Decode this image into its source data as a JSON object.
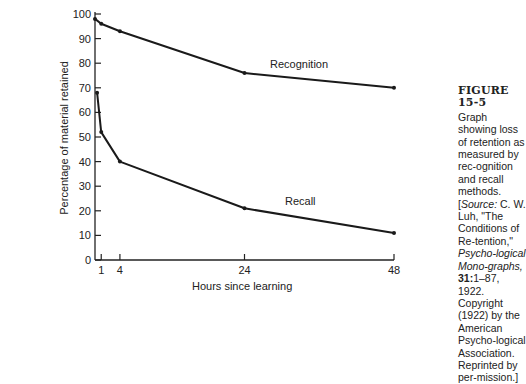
{
  "chart_data": {
    "type": "line",
    "title": "",
    "xlabel": "Hours since learning",
    "ylabel": "Percentage of material retained",
    "xlim": [
      0,
      48
    ],
    "ylim": [
      0,
      100
    ],
    "x_ticks": [
      1,
      4,
      24,
      48
    ],
    "y_ticks": [
      0,
      10,
      20,
      30,
      40,
      50,
      60,
      70,
      80,
      90,
      100
    ],
    "grid": false,
    "legend": "inline labels on lines",
    "series": [
      {
        "name": "Recognition",
        "x": [
          0,
          1,
          4,
          24,
          48
        ],
        "values": [
          98,
          96,
          93,
          76,
          70
        ]
      },
      {
        "name": "Recall",
        "x": [
          0.33,
          1,
          4,
          24,
          48
        ],
        "values": [
          68,
          52,
          40,
          21,
          11
        ]
      }
    ]
  },
  "labels": {
    "recognition": "Recognition",
    "recall": "Recall",
    "xlabel": "Hours since learning",
    "ylabel": "Percentage of material retained"
  },
  "caption": {
    "figure": "FIGURE 15-5",
    "line1": "Graph showing loss of retention as measured by rec-ognition and recall methods. [",
    "source_label": "Source:",
    "line2": " C. W. Luh, \"The Conditions of Re-tention,\" ",
    "journal": "Psycho-logical Mono-graphs,",
    "volume": " 31:",
    "line3": "1–87, 1922. Copyright (1922) by the American Psycho-logical Association. Reprinted by per-mission.]"
  }
}
